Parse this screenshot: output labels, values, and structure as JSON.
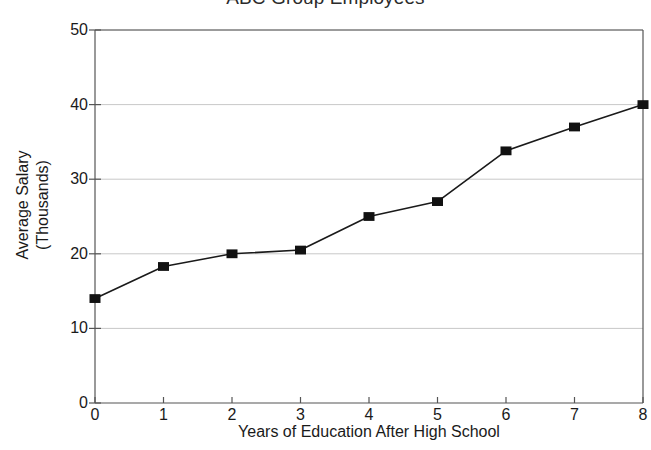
{
  "chart_data": {
    "type": "line",
    "title": "ABC Group Employees",
    "xlabel": "Years of Education After High School",
    "ylabel": "Average Salary (Thousands)",
    "ylabel_line1": "Average Salary",
    "ylabel_line2": "(Thousands)",
    "x": [
      0,
      1,
      2,
      3,
      4,
      5,
      6,
      7,
      8
    ],
    "values": [
      14,
      18.3,
      20,
      20.5,
      25,
      27,
      33.8,
      37,
      40
    ],
    "series": [
      {
        "name": "Average Salary",
        "values": [
          14,
          18.3,
          20,
          20.5,
          25,
          27,
          33.8,
          37,
          40
        ]
      }
    ],
    "xlim": [
      0,
      8
    ],
    "ylim": [
      0,
      50
    ],
    "xticks": [
      "0",
      "1",
      "2",
      "3",
      "4",
      "5",
      "6",
      "7",
      "8"
    ],
    "yticks": [
      "0",
      "10",
      "20",
      "30",
      "40",
      "50"
    ],
    "grid": "horizontal",
    "legend": "none",
    "marker": "filled-square",
    "line_color": "#1a1a1a",
    "marker_color": "#111111",
    "grid_color": "#c8c8c8",
    "axis_color": "#555555",
    "background": "#ffffff"
  }
}
